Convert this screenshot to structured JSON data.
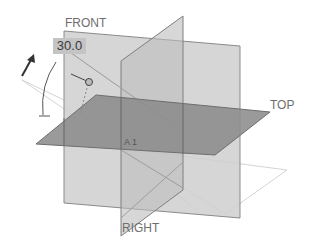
{
  "scene": {
    "type": "3d-reference-planes-viewport",
    "planes": [
      {
        "name": "FRONT",
        "label": "FRONT",
        "fill": "#c9c9c9"
      },
      {
        "name": "RIGHT",
        "label": "RIGHT",
        "fill": "#bdbdbd"
      },
      {
        "name": "TOP",
        "label": "TOP",
        "fill": "#8e8e8e"
      }
    ],
    "angle_dimension": {
      "value": "30.0"
    },
    "origin_label": "A 1",
    "colors": {
      "background": "#ffffff",
      "plane_edge": "#7a7a7a",
      "preview_outline": "#d6d6d6",
      "label_text": "#6e6e6e",
      "angle_box": "#c4c4c4"
    }
  }
}
